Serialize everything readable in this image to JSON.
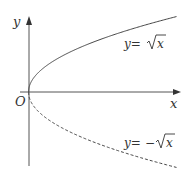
{
  "diagram": {
    "axes": {
      "x_label": "x",
      "y_label": "y",
      "origin_label": "O"
    },
    "curves": [
      {
        "name": "upper",
        "label_lhs": "y=",
        "label_sign": "",
        "label_rad": "x",
        "style": "solid",
        "equation": "y=√x"
      },
      {
        "name": "lower",
        "label_lhs": "y=",
        "label_sign": "−",
        "label_rad": "x",
        "style": "dashed",
        "equation": "y=−√x"
      }
    ],
    "colors": {
      "axis": "#555555",
      "curve": "#444444",
      "text": "#333333"
    }
  }
}
